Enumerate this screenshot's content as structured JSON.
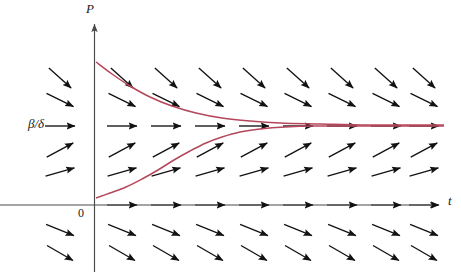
{
  "figure": {
    "kind": "slope-field",
    "background": "#ffffff"
  },
  "labels": {
    "p_axis": "P",
    "t_axis": "t",
    "origin": "0",
    "equilibrium": "β/δ"
  },
  "colors": {
    "axis": "#4a4a4a",
    "arrow": "#121212",
    "curve": "#b5475c",
    "text": "#1a1a1a"
  },
  "axes": {
    "x_axis_y": 205,
    "y_axis_x": 94,
    "y_axis_top": 18,
    "x_axis_right": 444,
    "y_axis_bottom": 272,
    "x_axis_left": 0
  },
  "chart_data": {
    "type": "line",
    "title": "",
    "xlabel": "t",
    "ylabel": "P",
    "grid": false,
    "legend": null,
    "annotations": [
      {
        "text": "β/δ",
        "x": 0,
        "y": 126,
        "role": "equilibrium-level"
      },
      {
        "text": "0",
        "x": 94,
        "y": 205,
        "role": "origin"
      }
    ],
    "equilibrium_y": 126,
    "arrow_columns_x": [
      60,
      122,
      166,
      210,
      254,
      298,
      342,
      386,
      424
    ],
    "arrow_rows": [
      {
        "y": 78,
        "slope_deg": 42,
        "note": "above equilibrium, strongly decreasing"
      },
      {
        "y": 100,
        "slope_deg": 26,
        "note": "above equilibrium, decreasing"
      },
      {
        "y": 126,
        "slope_deg": 0,
        "note": "equilibrium P = beta/delta, horizontal"
      },
      {
        "y": 150,
        "slope_deg": -28,
        "note": "below equilibrium, increasing"
      },
      {
        "y": 172,
        "slope_deg": -16,
        "note": "below equilibrium, increasing less"
      },
      {
        "y": 205,
        "slope_deg": 0,
        "note": "P = 0 equilibrium, horizontal on t-axis"
      },
      {
        "y": 230,
        "slope_deg": 22,
        "note": "negative P, decreasing"
      },
      {
        "y": 253,
        "slope_deg": 30,
        "note": "negative P, decreasing faster"
      }
    ],
    "series": [
      {
        "name": "solution-from-above",
        "kind": "decaying",
        "points": [
          [
            96,
            62
          ],
          [
            112,
            74
          ],
          [
            130,
            86
          ],
          [
            150,
            97
          ],
          [
            172,
            106
          ],
          [
            196,
            113
          ],
          [
            222,
            118
          ],
          [
            250,
            121
          ],
          [
            280,
            123
          ],
          [
            320,
            124
          ],
          [
            370,
            125
          ],
          [
            430,
            125
          ],
          [
            444,
            125
          ]
        ]
      },
      {
        "name": "solution-from-below",
        "kind": "sigmoid",
        "points": [
          [
            96,
            198
          ],
          [
            110,
            193
          ],
          [
            126,
            187
          ],
          [
            142,
            179
          ],
          [
            158,
            170
          ],
          [
            174,
            160
          ],
          [
            190,
            151
          ],
          [
            206,
            143
          ],
          [
            222,
            137
          ],
          [
            240,
            132
          ],
          [
            260,
            129
          ],
          [
            285,
            127
          ],
          [
            315,
            126
          ],
          [
            360,
            126
          ],
          [
            410,
            126
          ],
          [
            444,
            126
          ]
        ]
      }
    ]
  }
}
